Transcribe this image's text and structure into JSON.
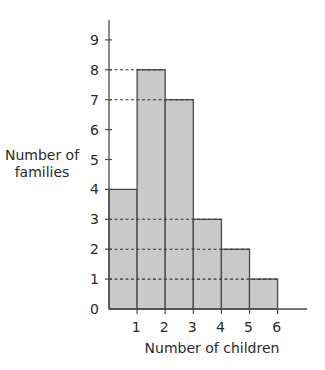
{
  "chart_data": {
    "type": "bar",
    "subtype": "histogram",
    "title": "",
    "xlabel": "Number of children",
    "ylabel": [
      "Number of",
      "families"
    ],
    "x_ticks": [
      "1",
      "2",
      "3",
      "4",
      "5",
      "6"
    ],
    "y_ticks": [
      "0",
      "1",
      "2",
      "3",
      "4",
      "5",
      "6",
      "7",
      "8",
      "9"
    ],
    "bins": [
      {
        "from": 0,
        "to": 1,
        "value": 4
      },
      {
        "from": 1,
        "to": 2,
        "value": 8
      },
      {
        "from": 2,
        "to": 3,
        "value": 7
      },
      {
        "from": 3,
        "to": 4,
        "value": 3
      },
      {
        "from": 4,
        "to": 5,
        "value": 2
      },
      {
        "from": 5,
        "to": 6,
        "value": 1
      }
    ],
    "categories": [
      "0-1",
      "1-2",
      "2-3",
      "3-4",
      "4-5",
      "5-6"
    ],
    "values": [
      4,
      8,
      7,
      3,
      2,
      1
    ],
    "ylim": [
      0,
      9
    ],
    "xlim": [
      0,
      7
    ],
    "dashed_reference_lines": [
      8,
      7,
      3,
      2,
      1
    ],
    "grid": false,
    "legend": null,
    "colors": {
      "bar_fill": "#c9c9c9",
      "bar_stroke": "#4a4a4a",
      "axis": "#4a4a4a",
      "dash": "#333333"
    }
  }
}
